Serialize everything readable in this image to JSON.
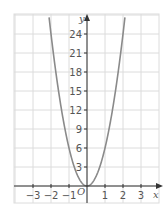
{
  "chart_data": {
    "type": "line",
    "title": "",
    "xlabel": "x",
    "ylabel": "y",
    "origin_label": "O",
    "function": "y = 6x^2",
    "x_ticks": [
      -3,
      -2,
      -1,
      1,
      2,
      3
    ],
    "x_tick_labels": [
      "−3",
      "−2",
      "−1",
      "1",
      "2",
      "3"
    ],
    "y_ticks": [
      3,
      6,
      9,
      12,
      15,
      18,
      21,
      24
    ],
    "y_tick_labels": [
      "3",
      "6",
      "9",
      "12",
      "15",
      "18",
      "21",
      "24"
    ],
    "xlim": [
      -4,
      4
    ],
    "ylim": [
      -3,
      27
    ],
    "grid": true,
    "series": [
      {
        "name": "parabola",
        "x": [
          -2.1,
          -2,
          -1.5,
          -1,
          -0.5,
          0,
          0.5,
          1,
          1.5,
          2,
          2.1
        ],
        "y": [
          26.46,
          24,
          13.5,
          6,
          1.5,
          0,
          1.5,
          6,
          13.5,
          24,
          26.46
        ]
      }
    ],
    "colors": {
      "curve": "#8a8a8a",
      "grid": "#dcdcdc",
      "axis": "#333333",
      "labels": "#555555"
    }
  }
}
